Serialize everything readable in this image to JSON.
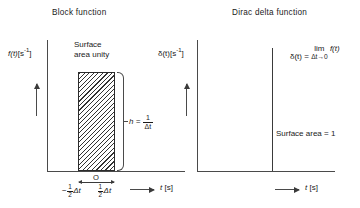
{
  "figure": {
    "background_color": "#ffffff",
    "line_color": "#3a3a3a",
    "text_color": "#1a1a1a"
  },
  "panels": {
    "block": {
      "title": "Block function",
      "y_axis_label_main": "f(t)",
      "y_axis_label_units": "[s",
      "y_axis_label_units_exp": "-1",
      "y_axis_label_units_close": "]",
      "annotation_surface": "Surface\narea unity",
      "annotation_surface_line1": "Surface",
      "annotation_surface_line2": "area unity",
      "height_label_symbol": "h =",
      "height_label_num": "1",
      "height_label_den": "Δt",
      "origin_label": "O",
      "tick_left_sign": "−",
      "tick_left_num": "1",
      "tick_left_den": "2",
      "tick_left_suffix": "Δt",
      "tick_right_num": "1",
      "tick_right_den": "2",
      "tick_right_suffix": "Δt",
      "x_axis_label_var": "t",
      "x_axis_label_units": "[s]"
    },
    "dirac": {
      "title": "Dirac delta function",
      "y_axis_label_main": "δ(t)",
      "y_axis_label_units": "[s",
      "y_axis_label_units_exp": "-1",
      "y_axis_label_units_close": "]",
      "equation_lhs": "δ(t) =",
      "equation_lim": "lim",
      "equation_lim_sub": "Δt→0",
      "equation_rhs": "f(t)",
      "annotation_area": "Surface area = 1",
      "x_axis_label_var": "t",
      "x_axis_label_units": "[s]"
    }
  }
}
